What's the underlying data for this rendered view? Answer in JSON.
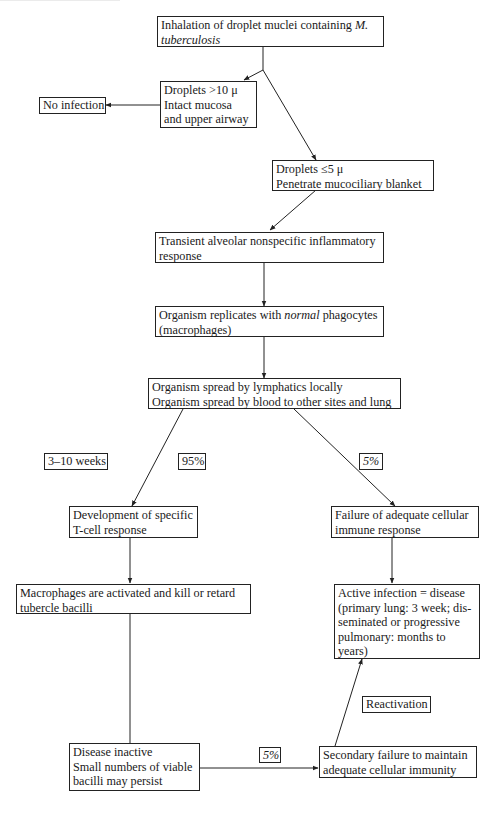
{
  "diagram": {
    "nodes": {
      "inhalation": {
        "line1_pre": "Inhalation of droplet muclei containing ",
        "line1_italic": "M.",
        "line2_italic": "tuberculosis"
      },
      "large_droplets": {
        "line1": "Droplets >10 μ",
        "line2": "Intact mucosa",
        "line3": "and upper airway"
      },
      "no_infection": {
        "text": "No infection"
      },
      "small_droplets": {
        "line1": "Droplets ≤5 μ",
        "line2": "Penetrate mucociliary blanket"
      },
      "transient_response": {
        "line1": "Transient alveolar nonspecific inflammatory",
        "line2": "response"
      },
      "replication": {
        "line1_pre": "Organism replicates with ",
        "line1_italic": "normal",
        "line1_post": " phagocytes",
        "line2": "(macrophages)"
      },
      "spread": {
        "line1": "Organism spread by lymphatics locally",
        "line2": "Organism spread by blood to other sites and lung"
      },
      "tcell": {
        "line1": "Development of specific",
        "line2": "T-cell response"
      },
      "failure": {
        "line1": "Failure of adequate cellular",
        "line2": "immune response"
      },
      "macrophages_activated": {
        "line1": "Macrophages are activated and kill or retard",
        "line2": "tubercle bacilli"
      },
      "active_infection": {
        "line1": "Active infection = disease",
        "line2": "(primary lung: 3 week; dis-",
        "line3": "seminated or progressive",
        "line4": "pulmonary: months to",
        "line5": "years)"
      },
      "inactive": {
        "line1": "Disease inactive",
        "line2": "Small numbers of viable",
        "line3": "bacilli may persist"
      },
      "secondary_failure": {
        "line1": "Secondary failure to maintain",
        "line2": "adequate cellular immunity"
      }
    },
    "edge_labels": {
      "time": "3–10 weeks",
      "pct_95": "95%",
      "pct_5_failure": "5%",
      "pct_5_secondary": "5%",
      "reactivation": "Reactivation"
    },
    "colors": {
      "line": "#222222",
      "background": "#ffffff"
    }
  }
}
